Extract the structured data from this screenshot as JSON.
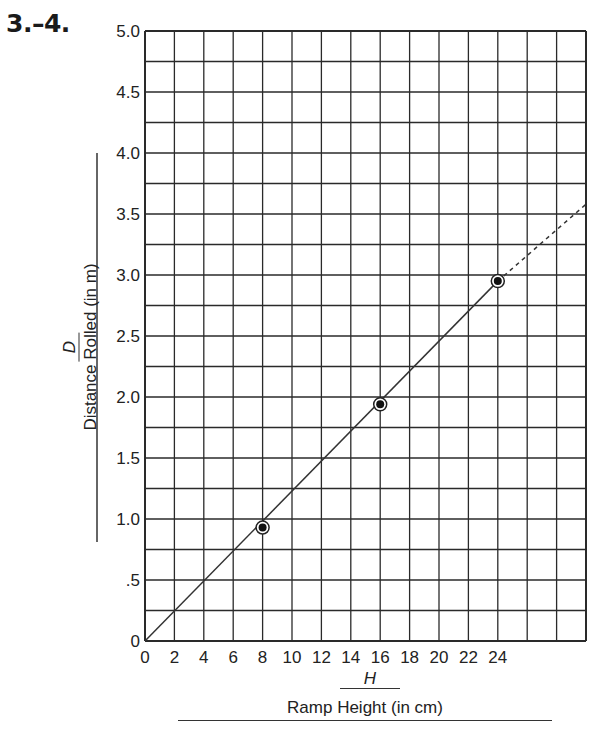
{
  "problem_number": "3.–4.",
  "chart_data": {
    "type": "scatter",
    "title": "",
    "xlabel_variable": "H",
    "xlabel": "Ramp Height (in cm)",
    "ylabel_variable": "D",
    "ylabel": "Distance Rolled (in m)",
    "xlim": [
      0,
      30
    ],
    "ylim": [
      0,
      5.0
    ],
    "grid": true,
    "x_ticks": [
      0,
      2,
      4,
      6,
      8,
      10,
      12,
      14,
      16,
      18,
      20,
      22,
      24
    ],
    "x_tick_labels": [
      "0",
      "2",
      "4",
      "6",
      "8",
      "10",
      "12",
      "14",
      "16",
      "18",
      "20",
      "22",
      "24"
    ],
    "x_grid_step": 2,
    "y_ticks": [
      0,
      0.5,
      1.0,
      1.5,
      2.0,
      2.5,
      3.0,
      3.5,
      4.0,
      4.5,
      5.0
    ],
    "y_tick_labels": [
      "0",
      ".5",
      "1.0",
      "1.5",
      "2.0",
      "2.5",
      "3.0",
      "3.5",
      "4.0",
      "4.5",
      "5.0"
    ],
    "y_grid_step": 0.25,
    "series": [
      {
        "name": "Measured points",
        "type": "scatter",
        "marker": "circled-dot",
        "x": [
          8,
          16,
          24
        ],
        "y": [
          0.93,
          1.94,
          2.95
        ]
      },
      {
        "name": "Best-fit line (solid)",
        "type": "line",
        "style": "solid",
        "x": [
          0,
          24
        ],
        "y": [
          0,
          2.95
        ]
      },
      {
        "name": "Extrapolation (dashed)",
        "type": "line",
        "style": "dashed",
        "x": [
          24,
          30
        ],
        "y": [
          2.95,
          3.58
        ]
      }
    ]
  }
}
